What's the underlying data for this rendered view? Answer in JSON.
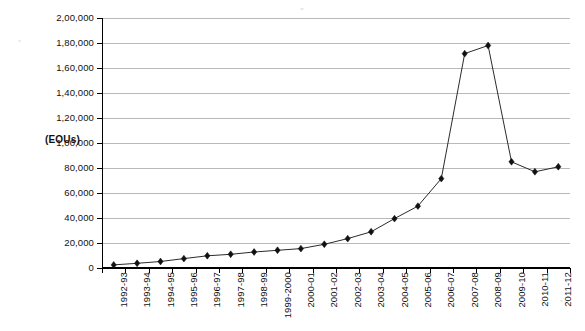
{
  "chart_data": {
    "type": "line",
    "title": "",
    "subtitle": "",
    "xlabel": "",
    "ylabel": "(EOUs)",
    "ylim": [
      0,
      200000
    ],
    "ytick_step": 20000,
    "grid": true,
    "legend": "none",
    "marker": "diamond",
    "line_color": "#2b2b2b",
    "marker_color": "#111111",
    "grid_color": "#b9b9b9",
    "categories": [
      "1992-93",
      "1993-94",
      "1994-95",
      "1995-96",
      "1996-97",
      "1997-98",
      "1998-99",
      "1999-2000",
      "2000-01",
      "2001-02",
      "2002-03",
      "2003-04",
      "2004-05",
      "2005-06",
      "2006-07",
      "2007-08",
      "2008-09",
      "2009-10",
      "2010-11",
      "2011-12"
    ],
    "ytick_labels": [
      "0",
      "20,000",
      "40,000",
      "60,000",
      "80,000",
      "1,00,000",
      "1,20,000",
      "1,40,000",
      "1,60,000",
      "1,80,000",
      "2,00,000"
    ],
    "ytick_values": [
      0,
      20000,
      40000,
      60000,
      80000,
      100000,
      120000,
      140000,
      160000,
      180000,
      200000
    ],
    "values": [
      2500,
      3800,
      5200,
      7500,
      9800,
      11000,
      12800,
      14200,
      15500,
      19000,
      23500,
      29000,
      39500,
      49500,
      71500,
      171500,
      178000,
      85000,
      77000,
      81000
    ],
    "series": [
      {
        "name": "EOUs",
        "values": [
          2500,
          3800,
          5200,
          7500,
          9800,
          11000,
          12800,
          14200,
          15500,
          19000,
          23500,
          29000,
          39500,
          49500,
          71500,
          171500,
          178000,
          85000,
          77000,
          81000
        ]
      }
    ]
  },
  "axis": {
    "unit_label": "(EOUs)"
  },
  "caption": {
    "text": ""
  }
}
